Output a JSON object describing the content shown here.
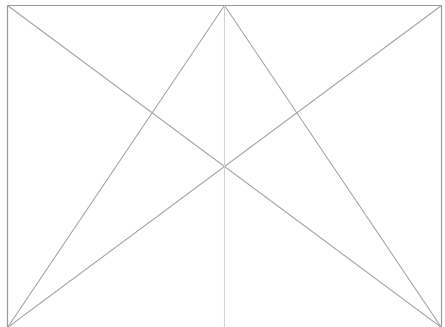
{
  "diagram": {
    "type": "wireframe-placeholder",
    "width": 445,
    "height": 327,
    "frame": {
      "x1": 7,
      "y1": 5,
      "x2": 441,
      "y2": 327,
      "stroke": "#9a9a9a",
      "bottom_border": false
    },
    "lines": [
      {
        "id": "diag-tl-br",
        "x1": 7,
        "y1": 5,
        "x2": 441,
        "y2": 327,
        "stroke": "#a6a6a6"
      },
      {
        "id": "diag-tr-bl",
        "x1": 441,
        "y1": 5,
        "x2": 7,
        "y2": 327,
        "stroke": "#a6a6a6"
      },
      {
        "id": "apex-bl",
        "x1": 224,
        "y1": 5,
        "x2": 7,
        "y2": 327,
        "stroke": "#a6a6a6"
      },
      {
        "id": "apex-br",
        "x1": 224,
        "y1": 5,
        "x2": 441,
        "y2": 327,
        "stroke": "#a6a6a6"
      },
      {
        "id": "center-vertical",
        "x1": 224,
        "y1": 5,
        "x2": 224,
        "y2": 327,
        "stroke": "#d2d2d2"
      }
    ]
  }
}
